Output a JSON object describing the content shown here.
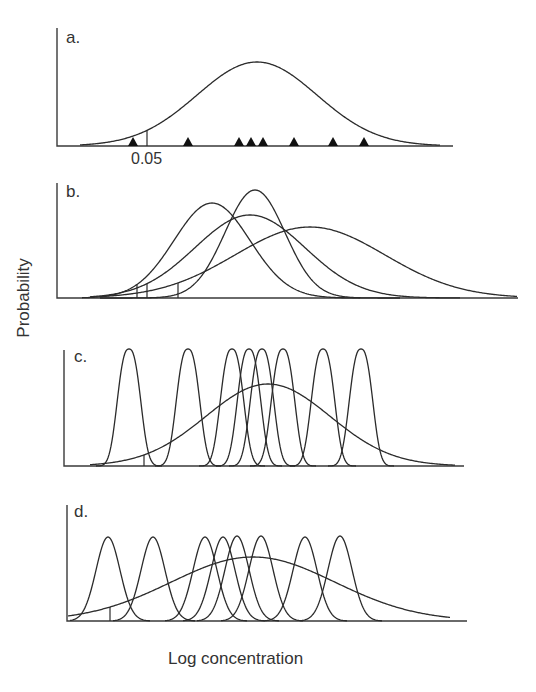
{
  "figure": {
    "y_axis_label": "Probability",
    "x_axis_label": "Log concentration",
    "line_color": "#2b2b2b",
    "background": "#ffffff"
  },
  "panels": [
    {
      "label": "a.",
      "axis": {
        "x0": 57,
        "ytop": 28,
        "baseline": 146,
        "xend": 453
      },
      "label_pos": {
        "x": 66,
        "y": 28
      },
      "curves": [
        {
          "kind": "gauss",
          "mu": 257,
          "sigma": 60,
          "peak_y": 62,
          "xmin": 80,
          "xmax": 440
        }
      ],
      "triangles_x": [
        133,
        188,
        239,
        251,
        263,
        294,
        333,
        364
      ],
      "ticks": [
        {
          "x": 147,
          "to_curve": 0
        }
      ],
      "tick_label": {
        "text": "0.05",
        "x": 131,
        "y": 150
      }
    },
    {
      "label": "b.",
      "axis": {
        "x0": 57,
        "ytop": 183,
        "baseline": 298,
        "xend": 518
      },
      "label_pos": {
        "x": 66,
        "y": 182
      },
      "curves": [
        {
          "kind": "gauss",
          "mu": 212,
          "sigma": 38,
          "peak_y": 203,
          "xmin": 82,
          "xmax": 360
        },
        {
          "kind": "gauss",
          "mu": 255,
          "sigma": 30,
          "peak_y": 190,
          "xmin": 100,
          "xmax": 400
        },
        {
          "kind": "gauss",
          "mu": 250,
          "sigma": 55,
          "peak_y": 215,
          "xmin": 90,
          "xmax": 460
        },
        {
          "kind": "gauss",
          "mu": 310,
          "sigma": 75,
          "peak_y": 227,
          "xmin": 100,
          "xmax": 517
        }
      ],
      "ticks": [
        {
          "x": 137,
          "to_curve": 0
        },
        {
          "x": 147,
          "to_curve": 2
        },
        {
          "x": 155,
          "to_curve": 1
        },
        {
          "x": 178,
          "to_curve": 3
        }
      ]
    },
    {
      "label": "c.",
      "axis": {
        "x0": 64,
        "ytop": 350,
        "baseline": 466,
        "xend": 464
      },
      "label_pos": {
        "x": 74,
        "y": 347
      },
      "curves": [
        {
          "kind": "gauss",
          "mu": 129,
          "sigma": 10,
          "peak_y": 349,
          "flat": true,
          "xmin": 96,
          "xmax": 162
        },
        {
          "kind": "gauss",
          "mu": 188,
          "sigma": 10,
          "peak_y": 349,
          "flat": true,
          "xmin": 155,
          "xmax": 221
        },
        {
          "kind": "gauss",
          "mu": 232,
          "sigma": 10,
          "peak_y": 349,
          "flat": true,
          "xmin": 199,
          "xmax": 265
        },
        {
          "kind": "gauss",
          "mu": 249,
          "sigma": 10,
          "peak_y": 349,
          "flat": true,
          "xmin": 216,
          "xmax": 282
        },
        {
          "kind": "gauss",
          "mu": 262,
          "sigma": 10,
          "peak_y": 349,
          "flat": true,
          "xmin": 229,
          "xmax": 295
        },
        {
          "kind": "gauss",
          "mu": 283,
          "sigma": 10,
          "peak_y": 349,
          "flat": true,
          "xmin": 250,
          "xmax": 316
        },
        {
          "kind": "gauss",
          "mu": 323,
          "sigma": 10,
          "peak_y": 349,
          "flat": true,
          "xmin": 290,
          "xmax": 356
        },
        {
          "kind": "gauss",
          "mu": 361,
          "sigma": 10,
          "peak_y": 349,
          "flat": true,
          "xmin": 328,
          "xmax": 394
        },
        {
          "kind": "gauss",
          "mu": 268,
          "sigma": 62,
          "peak_y": 384,
          "xmin": 90,
          "xmax": 455
        }
      ],
      "ticks": [
        {
          "x": 144,
          "to_curve": 8
        }
      ]
    },
    {
      "label": "d.",
      "axis": {
        "x0": 67,
        "ytop": 505,
        "baseline": 621,
        "xend": 467
      },
      "label_pos": {
        "x": 74,
        "y": 502
      },
      "curves": [
        {
          "kind": "gauss",
          "mu": 108,
          "sigma": 12,
          "peak_y": 537,
          "xmin": 70,
          "xmax": 150
        },
        {
          "kind": "gauss",
          "mu": 153,
          "sigma": 12,
          "peak_y": 537,
          "xmin": 113,
          "xmax": 195
        },
        {
          "kind": "gauss",
          "mu": 205,
          "sigma": 12,
          "peak_y": 537,
          "xmin": 165,
          "xmax": 247
        },
        {
          "kind": "gauss",
          "mu": 223,
          "sigma": 12,
          "peak_y": 537,
          "xmin": 183,
          "xmax": 265
        },
        {
          "kind": "gauss",
          "mu": 237,
          "sigma": 12,
          "peak_y": 536,
          "xmin": 197,
          "xmax": 279
        },
        {
          "kind": "gauss",
          "mu": 261,
          "sigma": 12,
          "peak_y": 536,
          "xmin": 221,
          "xmax": 303
        },
        {
          "kind": "gauss",
          "mu": 305,
          "sigma": 12,
          "peak_y": 537,
          "xmin": 265,
          "xmax": 347
        },
        {
          "kind": "gauss",
          "mu": 340,
          "sigma": 12,
          "peak_y": 536,
          "xmin": 300,
          "xmax": 382
        },
        {
          "kind": "gauss",
          "mu": 253,
          "sigma": 82,
          "peak_y": 557,
          "xmin": 68,
          "xmax": 450
        }
      ],
      "ticks": [
        {
          "x": 110,
          "to_curve": 8
        }
      ]
    }
  ]
}
